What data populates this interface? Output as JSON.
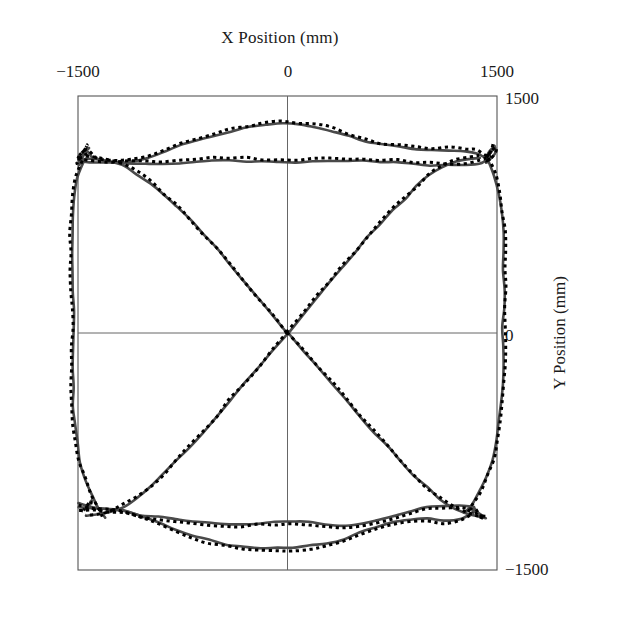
{
  "chart_data": {
    "type": "line",
    "title": "",
    "xlabel": "X Position (mm)",
    "ylabel": "Y Position (mm)",
    "xlim": [
      -1500,
      1500
    ],
    "ylim": [
      -1500,
      1500
    ],
    "xticks": [
      -1500,
      0,
      1500
    ],
    "yticks": [
      -1500,
      0,
      1500
    ],
    "xtick_labels": [
      "−1500",
      "0",
      "1500"
    ],
    "ytick_labels": [
      "−1500",
      "0",
      "1500"
    ],
    "xaxis_position": "top",
    "yaxis_position": "right",
    "grid": false,
    "legend": false,
    "zero_lines": true,
    "units": "mm",
    "series": [
      {
        "name": "measured-path-solid",
        "style": "solid",
        "color": "#4a4a4a",
        "width": 2.6,
        "description": "Continuous recorded X-Y trajectory: rounded-square perimeter loop plus four diagonal spokes crossing at the origin."
      },
      {
        "name": "reference-path-dotted",
        "style": "dotted",
        "color": "#000000",
        "width": 3.0,
        "description": "Dotted reference trajectory overlaid on and closely tracking the solid path."
      }
    ],
    "paths": {
      "perimeter_top": [
        [
          -1500,
          1105
        ],
        [
          -1440,
          1150
        ],
        [
          -1400,
          1120
        ],
        [
          -1350,
          1095
        ],
        [
          -1240,
          1085
        ],
        [
          -1120,
          1090
        ],
        [
          -1000,
          1110
        ],
        [
          -880,
          1150
        ],
        [
          -760,
          1190
        ],
        [
          -640,
          1225
        ],
        [
          -520,
          1255
        ],
        [
          -400,
          1280
        ],
        [
          -280,
          1300
        ],
        [
          -160,
          1315
        ],
        [
          -40,
          1322
        ],
        [
          80,
          1320
        ],
        [
          200,
          1305
        ],
        [
          320,
          1280
        ],
        [
          440,
          1245
        ],
        [
          560,
          1215
        ],
        [
          680,
          1190
        ],
        [
          800,
          1175
        ],
        [
          920,
          1165
        ],
        [
          1040,
          1160
        ],
        [
          1160,
          1160
        ],
        [
          1280,
          1155
        ],
        [
          1360,
          1140
        ],
        [
          1420,
          1115
        ],
        [
          1460,
          1150
        ],
        [
          1480,
          1190
        ]
      ],
      "perimeter_top_inner": [
        [
          -1500,
          1090
        ],
        [
          -1380,
          1080
        ],
        [
          -1260,
          1075
        ],
        [
          -1140,
          1072
        ],
        [
          -1020,
          1070
        ],
        [
          -900,
          1072
        ],
        [
          -780,
          1078
        ],
        [
          -660,
          1085
        ],
        [
          -540,
          1090
        ],
        [
          -420,
          1092
        ],
        [
          -300,
          1090
        ],
        [
          -180,
          1088
        ],
        [
          -60,
          1086
        ],
        [
          60,
          1085
        ],
        [
          180,
          1086
        ],
        [
          300,
          1088
        ],
        [
          420,
          1090
        ],
        [
          540,
          1090
        ],
        [
          660,
          1086
        ],
        [
          780,
          1080
        ],
        [
          900,
          1072
        ],
        [
          1020,
          1065
        ],
        [
          1140,
          1060
        ],
        [
          1260,
          1062
        ],
        [
          1380,
          1075
        ],
        [
          1450,
          1110
        ]
      ],
      "perimeter_left": [
        [
          -1460,
          1090
        ],
        [
          -1510,
          980
        ],
        [
          -1530,
          860
        ],
        [
          -1540,
          740
        ],
        [
          -1545,
          620
        ],
        [
          -1545,
          500
        ],
        [
          -1542,
          380
        ],
        [
          -1538,
          260
        ],
        [
          -1535,
          140
        ],
        [
          -1533,
          20
        ],
        [
          -1534,
          -100
        ],
        [
          -1536,
          -220
        ],
        [
          -1538,
          -340
        ],
        [
          -1535,
          -460
        ],
        [
          -1525,
          -580
        ],
        [
          -1505,
          -700
        ],
        [
          -1478,
          -820
        ],
        [
          -1440,
          -930
        ],
        [
          -1395,
          -1030
        ],
        [
          -1350,
          -1110
        ],
        [
          -1310,
          -1170
        ]
      ],
      "perimeter_right": [
        [
          1430,
          1100
        ],
        [
          1480,
          1000
        ],
        [
          1512,
          880
        ],
        [
          1530,
          760
        ],
        [
          1540,
          640
        ],
        [
          1545,
          520
        ],
        [
          1548,
          400
        ],
        [
          1548,
          280
        ],
        [
          1546,
          160
        ],
        [
          1544,
          40
        ],
        [
          1542,
          -80
        ],
        [
          1540,
          -200
        ],
        [
          1536,
          -320
        ],
        [
          1528,
          -440
        ],
        [
          1515,
          -560
        ],
        [
          1495,
          -680
        ],
        [
          1465,
          -800
        ],
        [
          1425,
          -910
        ],
        [
          1375,
          -1005
        ],
        [
          1320,
          -1085
        ],
        [
          1270,
          -1140
        ]
      ],
      "perimeter_bottom": [
        [
          -1490,
          -1080
        ],
        [
          -1380,
          -1105
        ],
        [
          -1270,
          -1110
        ],
        [
          -1160,
          -1125
        ],
        [
          -1040,
          -1160
        ],
        [
          -920,
          -1200
        ],
        [
          -800,
          -1240
        ],
        [
          -680,
          -1280
        ],
        [
          -560,
          -1310
        ],
        [
          -440,
          -1335
        ],
        [
          -320,
          -1352
        ],
        [
          -200,
          -1360
        ],
        [
          -80,
          -1362
        ],
        [
          40,
          -1358
        ],
        [
          160,
          -1348
        ],
        [
          280,
          -1330
        ],
        [
          400,
          -1300
        ],
        [
          520,
          -1262
        ],
        [
          640,
          -1225
        ],
        [
          760,
          -1195
        ],
        [
          880,
          -1180
        ],
        [
          1000,
          -1178
        ],
        [
          1120,
          -1185
        ],
        [
          1240,
          -1170
        ],
        [
          1330,
          -1130
        ]
      ],
      "perimeter_bottom_inner": [
        [
          -1500,
          -1105
        ],
        [
          -1390,
          -1108
        ],
        [
          -1280,
          -1115
        ],
        [
          -1170,
          -1128
        ],
        [
          -1050,
          -1148
        ],
        [
          -930,
          -1165
        ],
        [
          -810,
          -1180
        ],
        [
          -690,
          -1192
        ],
        [
          -570,
          -1200
        ],
        [
          -450,
          -1205
        ],
        [
          -330,
          -1206
        ],
        [
          -210,
          -1203
        ],
        [
          -90,
          -1198
        ],
        [
          30,
          -1196
        ],
        [
          150,
          -1200
        ],
        [
          270,
          -1210
        ],
        [
          390,
          -1215
        ],
        [
          510,
          -1210
        ],
        [
          630,
          -1190
        ],
        [
          750,
          -1160
        ],
        [
          870,
          -1130
        ],
        [
          990,
          -1105
        ],
        [
          1110,
          -1090
        ],
        [
          1230,
          -1085
        ],
        [
          1320,
          -1100
        ]
      ],
      "spoke_ne": [
        [
          0,
          0
        ],
        [
          110,
          120
        ],
        [
          210,
          225
        ],
        [
          300,
          320
        ],
        [
          390,
          415
        ],
        [
          480,
          510
        ],
        [
          570,
          600
        ],
        [
          660,
          690
        ],
        [
          750,
          775
        ],
        [
          840,
          855
        ],
        [
          930,
          930
        ],
        [
          1020,
          1000
        ],
        [
          1110,
          1055
        ],
        [
          1200,
          1090
        ],
        [
          1290,
          1105
        ],
        [
          1370,
          1110
        ]
      ],
      "spoke_nw": [
        [
          0,
          0
        ],
        [
          -110,
          115
        ],
        [
          -215,
          225
        ],
        [
          -315,
          330
        ],
        [
          -410,
          430
        ],
        [
          -505,
          525
        ],
        [
          -600,
          620
        ],
        [
          -695,
          710
        ],
        [
          -790,
          795
        ],
        [
          -885,
          875
        ],
        [
          -980,
          950
        ],
        [
          -1075,
          1010
        ],
        [
          -1170,
          1055
        ],
        [
          -1265,
          1085
        ],
        [
          -1360,
          1100
        ],
        [
          -1440,
          1105
        ]
      ],
      "spoke_sw": [
        [
          0,
          0
        ],
        [
          -110,
          -112
        ],
        [
          -215,
          -220
        ],
        [
          -315,
          -325
        ],
        [
          -412,
          -428
        ],
        [
          -508,
          -528
        ],
        [
          -604,
          -625
        ],
        [
          -700,
          -720
        ],
        [
          -796,
          -812
        ],
        [
          -892,
          -900
        ],
        [
          -988,
          -980
        ],
        [
          -1082,
          -1045
        ],
        [
          -1176,
          -1095
        ],
        [
          -1268,
          -1132
        ],
        [
          -1358,
          -1150
        ],
        [
          -1440,
          -1155
        ]
      ],
      "spoke_se": [
        [
          0,
          0
        ],
        [
          112,
          -108
        ],
        [
          220,
          -215
        ],
        [
          322,
          -320
        ],
        [
          420,
          -422
        ],
        [
          518,
          -522
        ],
        [
          615,
          -622
        ],
        [
          712,
          -718
        ],
        [
          808,
          -812
        ],
        [
          904,
          -900
        ],
        [
          1000,
          -982
        ],
        [
          1094,
          -1050
        ],
        [
          1188,
          -1105
        ],
        [
          1280,
          -1142
        ],
        [
          1360,
          -1160
        ],
        [
          1420,
          -1165
        ]
      ],
      "cusp_top_left": [
        [
          -1450,
          1145
        ],
        [
          -1420,
          1175
        ],
        [
          -1440,
          1150
        ],
        [
          -1480,
          1105
        ],
        [
          -1500,
          1060
        ],
        [
          -1470,
          1090
        ],
        [
          -1430,
          1110
        ],
        [
          -1450,
          1145
        ]
      ],
      "cusp_top_right": [
        [
          1420,
          1115
        ],
        [
          1455,
          1150
        ],
        [
          1490,
          1170
        ],
        [
          1480,
          1130
        ],
        [
          1450,
          1095
        ],
        [
          1415,
          1075
        ],
        [
          1420,
          1115
        ]
      ],
      "cusp_bottom_left": [
        [
          -1405,
          -1060
        ],
        [
          -1430,
          -1095
        ],
        [
          -1460,
          -1115
        ],
        [
          -1430,
          -1090
        ],
        [
          -1400,
          -1065
        ],
        [
          -1405,
          -1060
        ]
      ],
      "cusp_bottom_right": [
        [
          1330,
          -1105
        ],
        [
          1365,
          -1135
        ],
        [
          1395,
          -1160
        ],
        [
          1360,
          -1140
        ],
        [
          1330,
          -1110
        ],
        [
          1330,
          -1105
        ]
      ]
    }
  },
  "axes": {
    "x_title": "X Position (mm)",
    "y_title": "Y Position (mm)",
    "x_ticks": [
      {
        "label": "−1500",
        "value": -1500
      },
      {
        "label": "0",
        "value": 0
      },
      {
        "label": "1500",
        "value": 1500
      }
    ],
    "y_ticks": [
      {
        "label": "1500",
        "value": 1500
      },
      {
        "label": "0",
        "value": 0
      },
      {
        "label": "−1500",
        "value": -1500
      }
    ]
  },
  "colors": {
    "frame": "#555555",
    "zero_line": "#666666",
    "solid_trace": "#4a4a4a",
    "dotted_trace": "#000000",
    "background": "#ffffff",
    "text": "#1a1a1a"
  }
}
